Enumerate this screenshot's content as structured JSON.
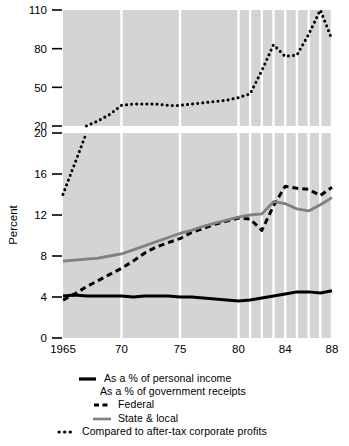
{
  "axis": {
    "ylabel": "Percent",
    "upper_ticks": [
      "110",
      "80",
      "50",
      "20"
    ],
    "lower_ticks": [
      "20",
      "16",
      "12",
      "8",
      "4",
      "0"
    ],
    "xticks": [
      "1965",
      "70",
      "75",
      "80",
      "84",
      "88"
    ]
  },
  "legend": {
    "items": [
      {
        "label": "As a % of personal income",
        "style": "solid-black",
        "swatch": "line-solid-black-icon"
      },
      {
        "label": "As a % of government receipts",
        "style": "none",
        "swatch": "no-swatch-icon"
      },
      {
        "label": "Federal",
        "style": "dashed-black",
        "swatch": "line-dashed-black-icon"
      },
      {
        "label": "State & local",
        "style": "solid-gray",
        "swatch": "line-solid-gray-icon"
      },
      {
        "label": "Compared to after-tax corporate profits",
        "style": "dotted-black",
        "swatch": "line-dotted-black-icon"
      }
    ]
  },
  "colors": {
    "plot_background": "#d4d4d4",
    "gridline": "#ffffff",
    "series_personal_income": "#000000",
    "series_federal": "#000000",
    "series_state_local": "#808080",
    "series_corporate_profits": "#000000"
  },
  "chart_data": {
    "type": "line",
    "title": "",
    "xlabel": "",
    "ylabel": "Percent",
    "grid": true,
    "legend_position": "bottom",
    "broken_axis": true,
    "lower_panel_ylim": [
      0,
      20
    ],
    "upper_panel_ylim": [
      20,
      110
    ],
    "upper_panel_tick_values": [
      20,
      50,
      80,
      110
    ],
    "lower_panel_tick_values": [
      0,
      4,
      8,
      12,
      16,
      20
    ],
    "x": [
      1965,
      1966,
      1967,
      1968,
      1969,
      1970,
      1971,
      1972,
      1973,
      1974,
      1975,
      1976,
      1977,
      1978,
      1979,
      1980,
      1981,
      1982,
      1983,
      1984,
      1985,
      1986,
      1987,
      1988
    ],
    "xlim": [
      1965,
      1988
    ],
    "gridline_years": [
      1970,
      1975,
      1980,
      1981,
      1982,
      1983,
      1984,
      1985,
      1986,
      1987,
      1988
    ],
    "series": [
      {
        "name": "As a % of personal income",
        "style": "solid-black",
        "panel": "lower",
        "values": [
          4.1,
          4.2,
          4.1,
          4.1,
          4.1,
          4.1,
          4.0,
          4.1,
          4.1,
          4.1,
          4.0,
          4.0,
          3.9,
          3.8,
          3.7,
          3.6,
          3.7,
          3.9,
          4.1,
          4.3,
          4.5,
          4.5,
          4.4,
          4.6
        ]
      },
      {
        "name": "Federal",
        "style": "dashed-black",
        "panel": "lower",
        "values": [
          3.7,
          4.3,
          5.0,
          5.6,
          6.2,
          6.8,
          7.5,
          8.3,
          8.9,
          9.3,
          9.7,
          10.3,
          10.7,
          11.1,
          11.4,
          11.7,
          11.6,
          10.5,
          12.9,
          14.8,
          14.6,
          14.5,
          13.9,
          14.7
        ]
      },
      {
        "name": "State & local",
        "style": "solid-gray",
        "panel": "lower",
        "values": [
          7.5,
          7.6,
          7.7,
          7.8,
          8.0,
          8.2,
          8.6,
          9.0,
          9.4,
          9.8,
          10.2,
          10.5,
          10.9,
          11.2,
          11.5,
          11.8,
          12.0,
          12.1,
          13.3,
          13.1,
          12.6,
          12.4,
          13.0,
          13.7
        ]
      },
      {
        "name": "Compared to after-tax corporate profits",
        "style": "dotted-black",
        "panel": "both",
        "values": [
          14,
          17,
          20,
          24,
          29,
          36,
          37,
          37,
          37,
          36,
          36,
          37,
          38,
          39,
          40,
          42,
          45,
          63,
          83,
          74,
          75,
          91,
          110,
          87
        ]
      }
    ]
  }
}
